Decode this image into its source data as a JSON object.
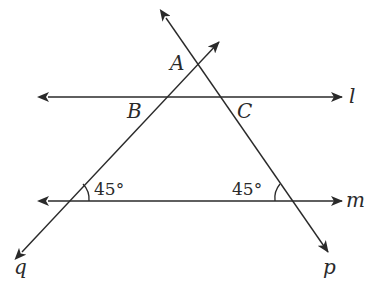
{
  "diagram": {
    "type": "geometry",
    "lines": [
      {
        "name": "l",
        "label": "l",
        "kind": "line",
        "orientation": "horizontal"
      },
      {
        "name": "m",
        "label": "m",
        "kind": "line",
        "orientation": "horizontal"
      },
      {
        "name": "p",
        "label": "p",
        "kind": "line",
        "orientation": "descending"
      },
      {
        "name": "q",
        "label": "q",
        "kind": "line",
        "orientation": "ascending"
      }
    ],
    "points": [
      {
        "name": "A",
        "label": "A",
        "on": [
          "p",
          "q"
        ]
      },
      {
        "name": "B",
        "label": "B",
        "on": [
          "q",
          "l"
        ]
      },
      {
        "name": "C",
        "label": "C",
        "on": [
          "p",
          "l"
        ]
      }
    ],
    "angles": [
      {
        "label": "45°",
        "at": "q ∩ m",
        "side": "interior-right"
      },
      {
        "label": "45°",
        "at": "p ∩ m",
        "side": "interior-left"
      }
    ]
  },
  "labels": {
    "A": "A",
    "B": "B",
    "C": "C",
    "l": "l",
    "m": "m",
    "p": "p",
    "q": "q",
    "angle_left": "45°",
    "angle_right": "45°"
  },
  "colors": {
    "stroke": "#2a2a2a",
    "background": "#ffffff"
  }
}
